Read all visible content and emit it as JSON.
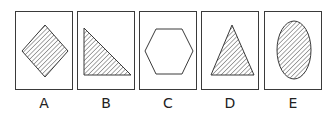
{
  "figure": {
    "options": [
      {
        "label": "A",
        "shape": "rotated-square",
        "fill": "hatched"
      },
      {
        "label": "B",
        "shape": "right-triangle",
        "fill": "hatched"
      },
      {
        "label": "C",
        "shape": "hexagon",
        "fill": "none"
      },
      {
        "label": "D",
        "shape": "triangle",
        "fill": "hatched"
      },
      {
        "label": "E",
        "shape": "ellipse",
        "fill": "hatched"
      }
    ],
    "colors": {
      "stroke": "#3a3a3a",
      "hatch": "#3a3a3a",
      "background": "#ffffff"
    }
  }
}
